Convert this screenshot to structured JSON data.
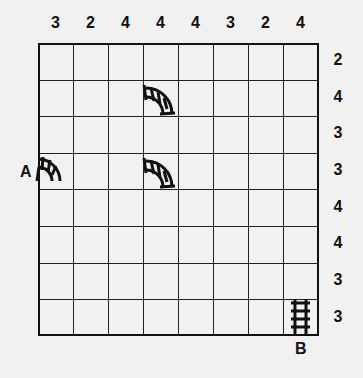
{
  "puzzle": {
    "title": "Train Tracks",
    "grid_size": {
      "rows": 8,
      "cols": 8
    },
    "column_clues": [
      "3",
      "2",
      "4",
      "4",
      "4",
      "3",
      "2",
      "4"
    ],
    "row_clues": [
      "2",
      "4",
      "3",
      "3",
      "4",
      "4",
      "3",
      "3"
    ],
    "start_label": "A",
    "end_label": "B",
    "given_pieces": [
      {
        "row": 1,
        "col": 3,
        "type": "curve",
        "connects": "west-south",
        "icon": "curve-track-icon"
      },
      {
        "row": 3,
        "col": 0,
        "type": "curve",
        "connects": "west-south",
        "icon": "curve-track-icon"
      },
      {
        "row": 3,
        "col": 3,
        "type": "curve",
        "connects": "west-south",
        "icon": "curve-track-icon"
      },
      {
        "row": 7,
        "col": 7,
        "type": "straight",
        "connects": "north-south",
        "icon": "straight-track-icon"
      }
    ],
    "colors": {
      "background": "#f1f1f1",
      "ink": "#111111"
    }
  }
}
